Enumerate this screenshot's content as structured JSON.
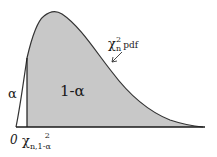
{
  "diagram": {
    "labels": {
      "alpha": "α",
      "one_minus_alpha": "1-α",
      "pdf_chi": "χ",
      "pdf_sup": "2",
      "pdf_sub": "n",
      "pdf_text": "pdf",
      "zero": "0",
      "crit_chi": "χ",
      "crit_sup": "2",
      "crit_sub": "n,1-α"
    },
    "colors": {
      "shaded_area": "#c8c8c8",
      "curve": "#333333",
      "axis": "#1a1a1a",
      "background": "#ffffff"
    }
  }
}
